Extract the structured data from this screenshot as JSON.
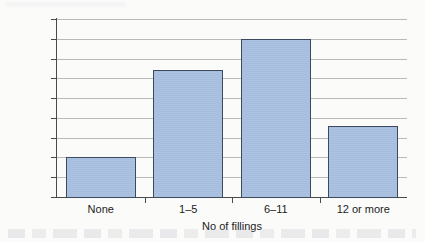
{
  "chart_data": {
    "type": "bar",
    "title": "",
    "subtitle": "",
    "xlabel": "No of fillings",
    "ylabel": "Proportion of adults",
    "categories": [
      "None",
      "1–5",
      "6–11",
      "12 or more"
    ],
    "values": [
      10,
      32,
      40,
      18
    ],
    "series": [
      {
        "name": "Proportion of adults",
        "values": [
          10,
          32,
          40,
          18
        ]
      }
    ],
    "ylim": [
      0,
      45
    ],
    "ytick_step": 5,
    "yticks": [
      0,
      5,
      10,
      15,
      20,
      25,
      30,
      35,
      40,
      45
    ],
    "ytick_labels": [
      "0",
      "5",
      "10",
      "15",
      "20",
      "25",
      "30",
      "35",
      "40",
      "45"
    ],
    "xlim_categories": 4,
    "grid": "horizontal",
    "legend": "none",
    "annotations": [],
    "colors": {
      "bar_fill": "#a8bfe0",
      "bar_border": "#3c4a5e",
      "gridline": "#b9b9b9",
      "axis": "#4a4a4a",
      "text": "#1b1b1b",
      "background": "#fbfbfa"
    }
  }
}
